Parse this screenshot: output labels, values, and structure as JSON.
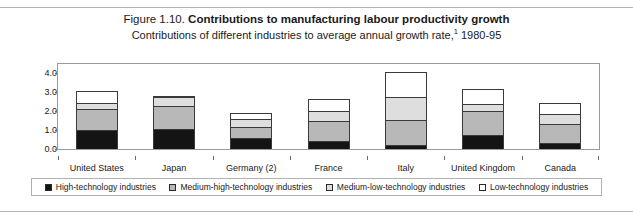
{
  "figure": {
    "label": "Figure 1.10.",
    "title": "Contributions to manufacturing labour productivity growth",
    "subtitle_before": "Contributions of different industries to average annual growth rate,",
    "subtitle_footnote": "1",
    "subtitle_after": " 1980-95"
  },
  "chart_data": {
    "type": "bar",
    "stacked": true,
    "title": "Contributions to manufacturing labour productivity growth",
    "subtitle": "Contributions of different industries to average annual growth rate,1 1980-95",
    "xlabel": "",
    "ylabel": "",
    "ylim": [
      0.0,
      4.5
    ],
    "yticks": [
      0.0,
      1.0,
      2.0,
      3.0,
      4.0
    ],
    "ytick_labels": [
      "0.0",
      "1.0",
      "2.0",
      "3.0",
      "4.0"
    ],
    "grid": false,
    "legend_position": "bottom",
    "categories": [
      "United States",
      "Japan",
      "Germany (2)",
      "France",
      "Italy",
      "United Kingdom",
      "Canada"
    ],
    "series": [
      {
        "name": "High-technology industries",
        "color": "#141414",
        "values": [
          1.0,
          1.05,
          0.6,
          0.4,
          0.2,
          0.75,
          0.3
        ]
      },
      {
        "name": "Medium-high-technology industries",
        "color": "#b8b8b8",
        "values": [
          1.1,
          1.25,
          0.55,
          1.1,
          1.35,
          1.25,
          1.05
        ]
      },
      {
        "name": "Medium-low-technology industries",
        "color": "#dedede",
        "values": [
          0.35,
          0.45,
          0.45,
          0.5,
          1.2,
          0.4,
          0.5
        ]
      },
      {
        "name": "Low-technology industries",
        "color": "#ffffff",
        "values": [
          0.6,
          0.05,
          0.3,
          0.65,
          1.35,
          0.8,
          0.6
        ]
      }
    ],
    "totals": [
      3.05,
      2.8,
      1.9,
      2.65,
      4.1,
      3.2,
      2.45
    ]
  },
  "legend": {
    "items": [
      {
        "label": "High-technology industries",
        "color": "#141414"
      },
      {
        "label": "Medium-high-technology industries",
        "color": "#b8b8b8"
      },
      {
        "label": "Medium-low-technology industries",
        "color": "#dedede"
      },
      {
        "label": "Low-technology industries",
        "color": "#ffffff"
      }
    ]
  }
}
